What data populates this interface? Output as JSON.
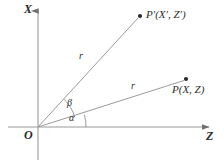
{
  "figure": {
    "background_color": "#ffffff",
    "line_color": "#8c8c8c",
    "text_color": "#2b2b2b"
  },
  "axes": {
    "vertical": {
      "name": "X",
      "label": "X",
      "x": 38,
      "y_top": 8,
      "y_bottom": 160,
      "arrow": "up"
    },
    "horizontal": {
      "name": "Z",
      "label": "Z",
      "x_left": 8,
      "x_right": 212,
      "y": 127,
      "arrow": "right"
    },
    "origin": {
      "label": "O",
      "x": 38,
      "y": 127
    }
  },
  "points": [
    {
      "id": "p-prime",
      "label": "P′(X′, Z′)",
      "x": 140,
      "y": 16,
      "dot": true
    },
    {
      "id": "p",
      "label": "P(X, Z)",
      "x": 186,
      "y": 79,
      "dot": true
    }
  ],
  "rays": [
    {
      "id": "ray-to-p-prime",
      "from": "O",
      "to": "P′(X′, Z′)",
      "length_label": "r",
      "label_x": 79,
      "label_y": 57,
      "angle_deg": 47
    },
    {
      "id": "ray-to-p",
      "from": "O",
      "to": "P(X, Z)",
      "length_label": "r",
      "label_x": 131,
      "label_y": 87,
      "angle_deg": 15
    }
  ],
  "angles": [
    {
      "id": "angle-beta",
      "label": "β",
      "label_x": 67,
      "label_y": 101,
      "from_deg": 15,
      "to_deg": 47,
      "radius": 38
    },
    {
      "id": "angle-alpha",
      "label": "α",
      "label_x": 69,
      "label_y": 115,
      "from_deg": 0,
      "to_deg": 15,
      "radius": 48
    }
  ]
}
